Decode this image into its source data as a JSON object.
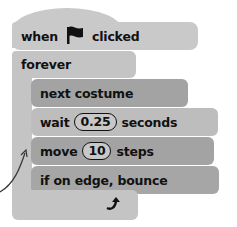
{
  "script": {
    "hat_block": {
      "label_before": "when",
      "icon": "green-flag-icon",
      "label_after": "clicked"
    },
    "forever_block": {
      "label": "forever",
      "loop_icon": "loop-arrow-icon"
    },
    "inner_blocks": [
      {
        "label": "next costume"
      },
      {
        "label_before": "wait",
        "value": "0.25",
        "label_after": "seconds"
      },
      {
        "label_before": "move",
        "value": "10",
        "label_after": "steps"
      },
      {
        "label": "if on edge, bounce"
      }
    ]
  },
  "colors": {
    "hat": "#c9c9c9",
    "forever": "#c4c4c4",
    "dark_block": "#a3a3a3",
    "light_block": "#bdbdbd"
  }
}
